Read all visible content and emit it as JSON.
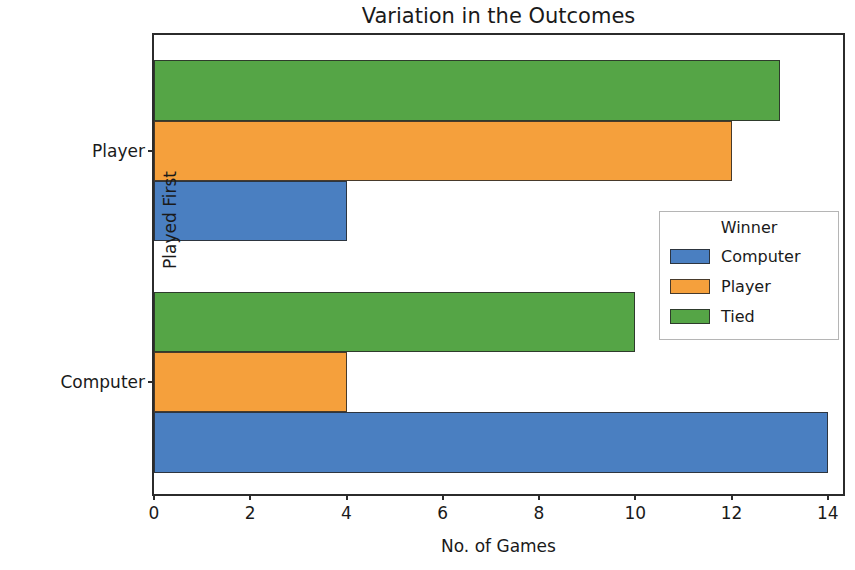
{
  "chart_data": {
    "type": "bar",
    "orientation": "horizontal",
    "title": "Variation in the Outcomes",
    "xlabel": "No. of Games",
    "ylabel": "Played First",
    "categories": [
      "Computer",
      "Player"
    ],
    "category_order_top_to_bottom": [
      "Player",
      "Computer"
    ],
    "series": [
      {
        "name": "Computer",
        "color": "#4a7fc1",
        "values": [
          14,
          4
        ]
      },
      {
        "name": "Player",
        "color": "#f5a03c",
        "values": [
          4,
          12
        ]
      },
      {
        "name": "Tied",
        "color": "#55a546",
        "values": [
          10,
          13
        ]
      }
    ],
    "xticks": [
      0,
      2,
      4,
      6,
      8,
      10,
      12,
      14
    ],
    "xtick_labels": [
      "0",
      "2",
      "4",
      "6",
      "8",
      "10",
      "12",
      "14"
    ],
    "xlim": [
      0,
      14.4
    ],
    "grid": false,
    "legend": {
      "title": "Winner",
      "position": "center-right",
      "entries": [
        {
          "label": "Computer",
          "color": "#4a7fc1"
        },
        {
          "label": "Player",
          "color": "#f5a03c"
        },
        {
          "label": "Tied",
          "color": "#55a546"
        }
      ]
    }
  }
}
